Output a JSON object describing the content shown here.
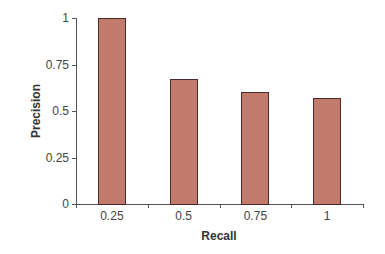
{
  "chart_data": {
    "type": "bar",
    "title": "",
    "xlabel": "Recall",
    "ylabel": "Precision",
    "categories": [
      "0.25",
      "0.5",
      "0.75",
      "1"
    ],
    "values": [
      1.0,
      0.67,
      0.6,
      0.57
    ],
    "ylim": [
      0,
      1
    ],
    "yticks": [
      "0",
      "0.25",
      "0.5",
      "0.75",
      "1"
    ],
    "grid": false,
    "legend": null,
    "bar_color": "#c27a6d",
    "bar_border_color": "#4a2a2a"
  }
}
